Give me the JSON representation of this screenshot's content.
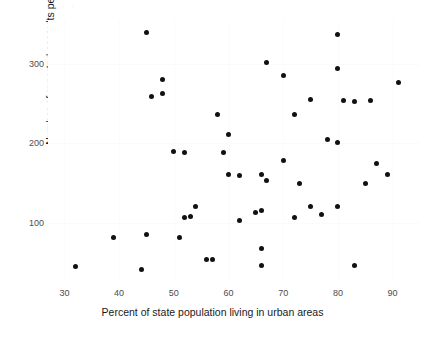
{
  "figure": {
    "background": "#ffffff",
    "point_color": "#111111",
    "axis_text_color": "#4d4d4d",
    "label_color": "#1a1a1a",
    "top_fragment": ". ."
  },
  "chart_data": {
    "type": "scatter",
    "title": "",
    "xlabel": "Percent of state population living in urban areas",
    "ylabel": "Number of reported assaults per 100,000 annually",
    "xticks": [
      30,
      40,
      50,
      60,
      70,
      80,
      90
    ],
    "yticks": [
      100,
      200,
      300
    ],
    "xlim": [
      27,
      95
    ],
    "ylim": [
      25,
      355
    ],
    "grid": false,
    "legend": null,
    "points": [
      {
        "x": 32,
        "y": 45
      },
      {
        "x": 39,
        "y": 81
      },
      {
        "x": 44,
        "y": 41
      },
      {
        "x": 45,
        "y": 339
      },
      {
        "x": 45,
        "y": 85
      },
      {
        "x": 46,
        "y": 259
      },
      {
        "x": 48,
        "y": 280
      },
      {
        "x": 48,
        "y": 263
      },
      {
        "x": 50,
        "y": 190
      },
      {
        "x": 51,
        "y": 81
      },
      {
        "x": 52,
        "y": 188
      },
      {
        "x": 52,
        "y": 106
      },
      {
        "x": 53,
        "y": 107
      },
      {
        "x": 54,
        "y": 120
      },
      {
        "x": 56,
        "y": 53
      },
      {
        "x": 57,
        "y": 54
      },
      {
        "x": 58,
        "y": 236
      },
      {
        "x": 59,
        "y": 188
      },
      {
        "x": 60,
        "y": 211
      },
      {
        "x": 60,
        "y": 161
      },
      {
        "x": 62,
        "y": 102
      },
      {
        "x": 62,
        "y": 159
      },
      {
        "x": 65,
        "y": 113
      },
      {
        "x": 66,
        "y": 115
      },
      {
        "x": 66,
        "y": 67
      },
      {
        "x": 66,
        "y": 46
      },
      {
        "x": 66,
        "y": 161
      },
      {
        "x": 67,
        "y": 301
      },
      {
        "x": 67,
        "y": 153
      },
      {
        "x": 70,
        "y": 285
      },
      {
        "x": 70,
        "y": 178
      },
      {
        "x": 72,
        "y": 236
      },
      {
        "x": 72,
        "y": 106
      },
      {
        "x": 73,
        "y": 149
      },
      {
        "x": 75,
        "y": 255
      },
      {
        "x": 75,
        "y": 120
      },
      {
        "x": 77,
        "y": 110
      },
      {
        "x": 78,
        "y": 204
      },
      {
        "x": 80,
        "y": 201
      },
      {
        "x": 80,
        "y": 337
      },
      {
        "x": 80,
        "y": 294
      },
      {
        "x": 80,
        "y": 120
      },
      {
        "x": 81,
        "y": 254
      },
      {
        "x": 83,
        "y": 252
      },
      {
        "x": 83,
        "y": 46
      },
      {
        "x": 85,
        "y": 149
      },
      {
        "x": 86,
        "y": 254
      },
      {
        "x": 87,
        "y": 174
      },
      {
        "x": 89,
        "y": 161
      },
      {
        "x": 91,
        "y": 276
      }
    ]
  }
}
